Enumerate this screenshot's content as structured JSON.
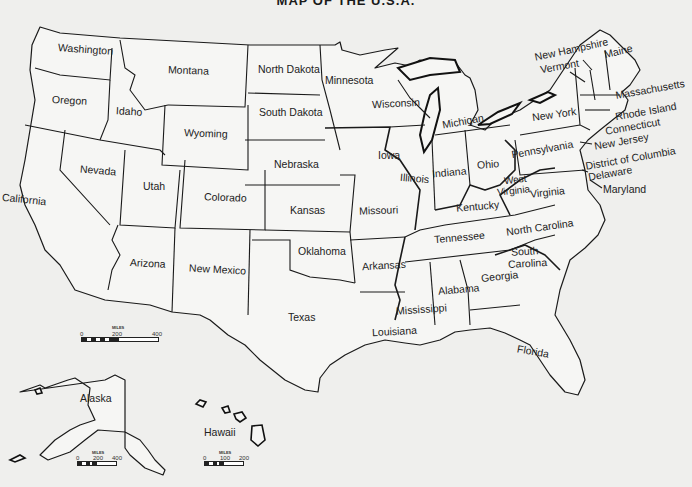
{
  "title": "MAP OF THE U.S.A.",
  "states": {
    "washington": "Washington",
    "oregon": "Oregon",
    "california": "California",
    "idaho": "Idaho",
    "nevada": "Nevada",
    "montana": "Montana",
    "wyoming": "Wyoming",
    "utah": "Utah",
    "colorado": "Colorado",
    "arizona": "Arizona",
    "new_mexico": "New Mexico",
    "north_dakota": "North Dakota",
    "south_dakota": "South Dakota",
    "nebraska": "Nebraska",
    "kansas": "Kansas",
    "oklahoma": "Oklahoma",
    "texas": "Texas",
    "minnesota": "Minnesota",
    "iowa": "Iowa",
    "missouri": "Missouri",
    "arkansas": "Arkansas",
    "louisiana": "Louisiana",
    "wisconsin": "Wisconsin",
    "illinois": "Illinois",
    "michigan": "Michigan",
    "indiana": "Indiana",
    "ohio": "Ohio",
    "kentucky": "Kentucky",
    "tennessee": "Tennessee",
    "mississippi": "Mississippi",
    "alabama": "Alabama",
    "georgia": "Georgia",
    "florida": "Florida",
    "south_carolina_1": "South",
    "south_carolina_2": "Carolina",
    "north_carolina": "North Carolina",
    "virginia": "Virginia",
    "west_virginia_1": "West",
    "west_virginia_2": "Virginia",
    "pennsylvania": "Pennsylvania",
    "new_york": "New York",
    "vermont": "Vermont",
    "new_hampshire": "New Hampshire",
    "maine": "Maine",
    "massachusetts": "Massachusetts",
    "rhode_island": "Rhode Island",
    "connecticut": "Connecticut",
    "new_jersey": "New Jersey",
    "district_of_columbia": "District of Columbia",
    "delaware": "Delaware",
    "maryland": "Maryland",
    "alaska": "Alaska",
    "hawaii": "Hawaii"
  },
  "scales": {
    "main": {
      "unit": "MILES",
      "ticks": [
        "0",
        "200",
        "400"
      ]
    },
    "alaska": {
      "unit": "MILES",
      "ticks": [
        "0",
        "200",
        "400"
      ]
    },
    "hawaii": {
      "unit": "MILES",
      "ticks": [
        "0",
        "100",
        "200"
      ]
    }
  }
}
